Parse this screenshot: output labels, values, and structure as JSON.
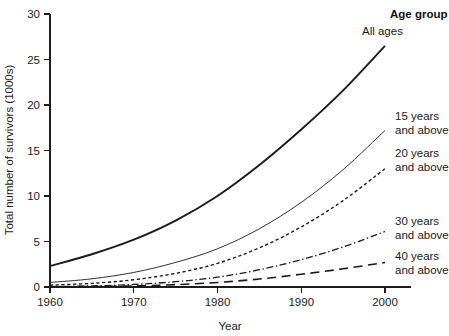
{
  "chart_data": {
    "type": "line",
    "title": "",
    "xlabel": "Year",
    "ylabel": "Total number of survivors (1000s)",
    "xlim": [
      1960,
      2000
    ],
    "ylim": [
      0,
      30
    ],
    "xticks": [
      1960,
      1970,
      1980,
      1990,
      2000
    ],
    "xticklabels": [
      "1960",
      "1970",
      "1980",
      "1990",
      "2000"
    ],
    "yticks": [
      0,
      5,
      10,
      15,
      20,
      25,
      30
    ],
    "yticklabels": [
      "0",
      "5",
      "10",
      "15",
      "20",
      "25",
      "30"
    ],
    "grid": false,
    "legend_position": "right-inline-labels",
    "legend_title": "Age group",
    "x": [
      1960,
      1965,
      1970,
      1975,
      1980,
      1985,
      1990,
      1995,
      2000
    ],
    "series": [
      {
        "name": "All ages",
        "label": "All ages",
        "style": "solid-thick",
        "color": "#1a1a1a",
        "values": [
          2.3,
          3.6,
          5.2,
          7.3,
          10.0,
          13.4,
          17.3,
          21.6,
          26.5
        ]
      },
      {
        "name": "15 years and above",
        "label": "15 years\nand above",
        "label_line1": "15 years",
        "label_line2": "and above",
        "style": "solid-thin",
        "color": "#5a5a5a",
        "values": [
          0.5,
          0.9,
          1.6,
          2.7,
          4.2,
          6.4,
          9.3,
          12.9,
          17.2
        ]
      },
      {
        "name": "20 years and above",
        "label_line1": "20 years",
        "label_line2": "and above",
        "style": "dotted",
        "color": "#1a1a1a",
        "values": [
          0.2,
          0.4,
          0.8,
          1.5,
          2.6,
          4.3,
          6.6,
          9.5,
          13.0
        ]
      },
      {
        "name": "30 years and above",
        "label_line1": "30 years",
        "label_line2": "and above",
        "style": "dash-dot",
        "color": "#1a1a1a",
        "values": [
          0.05,
          0.12,
          0.28,
          0.58,
          1.08,
          1.9,
          3.0,
          4.4,
          6.1
        ]
      },
      {
        "name": "40 years and above",
        "label_line1": "40 years",
        "label_line2": "and above",
        "style": "long-dash",
        "color": "#1a1a1a",
        "values": [
          0.02,
          0.05,
          0.12,
          0.26,
          0.5,
          0.88,
          1.4,
          2.0,
          2.7
        ]
      }
    ]
  }
}
